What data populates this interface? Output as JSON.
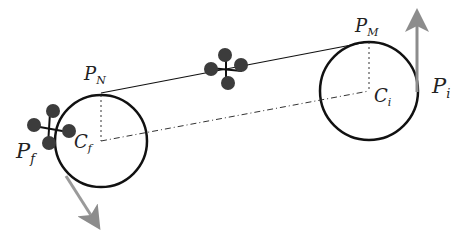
{
  "diagram": {
    "labels": {
      "p_n": {
        "main": "P",
        "sub": "N"
      },
      "p_m": {
        "main": "P",
        "sub": "M"
      },
      "c_f": {
        "main": "C",
        "sub": "f"
      },
      "c_i": {
        "main": "C",
        "sub": "i"
      },
      "p_f": {
        "main": "P",
        "sub": "f"
      },
      "p_i": {
        "main": "P",
        "sub": "i"
      }
    },
    "colors": {
      "stroke": "#111111",
      "arrow": "#8c8c8c",
      "drone": "#3c3c3c"
    }
  }
}
